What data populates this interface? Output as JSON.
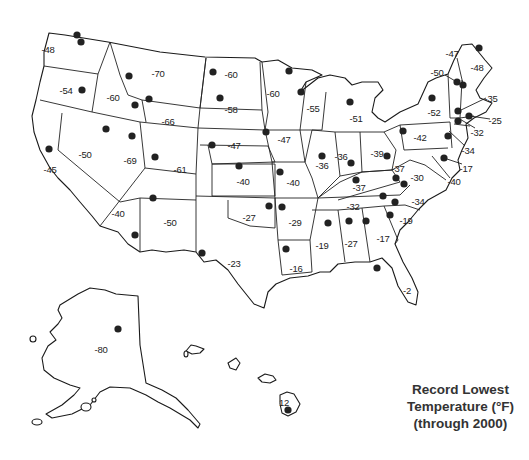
{
  "title": {
    "line1": "Record Lowest",
    "line2": "Temperature (°F)",
    "line3": "(through 2000)"
  },
  "states": [
    {
      "state": "Washington",
      "value": "-48",
      "x": 48,
      "y": 49
    },
    {
      "state": "Oregon",
      "value": "-54",
      "x": 66,
      "y": 90
    },
    {
      "state": "California",
      "value": "-45",
      "x": 50,
      "y": 169
    },
    {
      "state": "Nevada",
      "value": "-50",
      "x": 85,
      "y": 154
    },
    {
      "state": "Idaho",
      "value": "-60",
      "x": 113,
      "y": 97
    },
    {
      "state": "Montana",
      "value": "-70",
      "x": 158,
      "y": 73
    },
    {
      "state": "Wyoming",
      "value": "-66",
      "x": 168,
      "y": 121
    },
    {
      "state": "Utah",
      "value": "-69",
      "x": 130,
      "y": 160
    },
    {
      "state": "Colorado",
      "value": "-61",
      "x": 180,
      "y": 169
    },
    {
      "state": "Arizona",
      "value": "-40",
      "x": 118,
      "y": 213
    },
    {
      "state": "New Mexico",
      "value": "-50",
      "x": 170,
      "y": 222
    },
    {
      "state": "North Dakota",
      "value": "-60",
      "x": 231,
      "y": 74
    },
    {
      "state": "South Dakota",
      "value": "-58",
      "x": 231,
      "y": 109
    },
    {
      "state": "Nebraska",
      "value": "-47",
      "x": 234,
      "y": 145
    },
    {
      "state": "Kansas",
      "value": "-40",
      "x": 243,
      "y": 181
    },
    {
      "state": "Oklahoma",
      "value": "-27",
      "x": 249,
      "y": 217
    },
    {
      "state": "Texas",
      "value": "-23",
      "x": 234,
      "y": 263
    },
    {
      "state": "Minnesota",
      "value": "-60",
      "x": 273,
      "y": 93
    },
    {
      "state": "Iowa",
      "value": "-47",
      "x": 284,
      "y": 139
    },
    {
      "state": "Missouri",
      "value": "-40",
      "x": 293,
      "y": 182
    },
    {
      "state": "Arkansas",
      "value": "-29",
      "x": 295,
      "y": 222
    },
    {
      "state": "Louisiana",
      "value": "-16",
      "x": 296,
      "y": 268
    },
    {
      "state": "Wisconsin",
      "value": "-55",
      "x": 313,
      "y": 108
    },
    {
      "state": "Illinois",
      "value": "-36",
      "x": 322,
      "y": 165
    },
    {
      "state": "Michigan",
      "value": "-51",
      "x": 356,
      "y": 118
    },
    {
      "state": "Indiana",
      "value": "-36",
      "x": 341,
      "y": 156
    },
    {
      "state": "Ohio",
      "value": "-39",
      "x": 377,
      "y": 153
    },
    {
      "state": "Kentucky",
      "value": "-37",
      "x": 359,
      "y": 187
    },
    {
      "state": "Tennessee",
      "value": "-32",
      "x": 353,
      "y": 206
    },
    {
      "state": "Mississippi",
      "value": "-19",
      "x": 322,
      "y": 245
    },
    {
      "state": "Alabama",
      "value": "-27",
      "x": 351,
      "y": 243
    },
    {
      "state": "Georgia",
      "value": "-17",
      "x": 383,
      "y": 238
    },
    {
      "state": "Florida",
      "value": "-2",
      "x": 407,
      "y": 290
    },
    {
      "state": "South Carolina",
      "value": "-19",
      "x": 406,
      "y": 220
    },
    {
      "state": "North Carolina",
      "value": "-34",
      "x": 418,
      "y": 201
    },
    {
      "state": "Virginia",
      "value": "-30",
      "x": 417,
      "y": 177
    },
    {
      "state": "West Virginia",
      "value": "-37",
      "x": 398,
      "y": 168
    },
    {
      "state": "Pennsylvania",
      "value": "-42",
      "x": 420,
      "y": 137
    },
    {
      "state": "New York",
      "value": "-52",
      "x": 434,
      "y": 112
    },
    {
      "state": "Maryland",
      "value": "-40",
      "x": 454,
      "y": 181
    },
    {
      "state": "Delaware",
      "value": "-17",
      "x": 466,
      "y": 168
    },
    {
      "state": "New Jersey",
      "value": "-34",
      "x": 468,
      "y": 150
    },
    {
      "state": "Connecticut",
      "value": "-32",
      "x": 477,
      "y": 132
    },
    {
      "state": "Rhode Island",
      "value": "-25",
      "x": 495,
      "y": 120
    },
    {
      "state": "Massachusetts",
      "value": "-35",
      "x": 491,
      "y": 98
    },
    {
      "state": "Vermont",
      "value": "-50",
      "x": 437,
      "y": 72
    },
    {
      "state": "New Hampshire",
      "value": "-47",
      "x": 452,
      "y": 53
    },
    {
      "state": "Maine",
      "value": "-48",
      "x": 477,
      "y": 67
    },
    {
      "state": "Alaska",
      "value": "-80",
      "x": 101,
      "y": 349
    },
    {
      "state": "Hawaii",
      "value": "12",
      "x": 284,
      "y": 402
    }
  ],
  "chart_data": {
    "type": "table",
    "title": "Record Lowest Temperature (°F) (through 2000)",
    "unit": "°F",
    "columns": [
      "state",
      "record_low_f"
    ],
    "rows": [
      [
        "Alabama",
        -27
      ],
      [
        "Alaska",
        -80
      ],
      [
        "Arizona",
        -40
      ],
      [
        "Arkansas",
        -29
      ],
      [
        "California",
        -45
      ],
      [
        "Colorado",
        -61
      ],
      [
        "Connecticut",
        -32
      ],
      [
        "Delaware",
        -17
      ],
      [
        "Florida",
        -2
      ],
      [
        "Georgia",
        -17
      ],
      [
        "Hawaii",
        12
      ],
      [
        "Idaho",
        -60
      ],
      [
        "Illinois",
        -36
      ],
      [
        "Indiana",
        -36
      ],
      [
        "Iowa",
        -47
      ],
      [
        "Kansas",
        -40
      ],
      [
        "Kentucky",
        -37
      ],
      [
        "Louisiana",
        -16
      ],
      [
        "Maine",
        -48
      ],
      [
        "Maryland",
        -40
      ],
      [
        "Massachusetts",
        -35
      ],
      [
        "Michigan",
        -51
      ],
      [
        "Minnesota",
        -60
      ],
      [
        "Mississippi",
        -19
      ],
      [
        "Missouri",
        -40
      ],
      [
        "Montana",
        -70
      ],
      [
        "Nebraska",
        -47
      ],
      [
        "Nevada",
        -50
      ],
      [
        "New Hampshire",
        -47
      ],
      [
        "New Jersey",
        -34
      ],
      [
        "New Mexico",
        -50
      ],
      [
        "New York",
        -52
      ],
      [
        "North Carolina",
        -34
      ],
      [
        "North Dakota",
        -60
      ],
      [
        "Ohio",
        -39
      ],
      [
        "Oklahoma",
        -27
      ],
      [
        "Oregon",
        -54
      ],
      [
        "Pennsylvania",
        -42
      ],
      [
        "Rhode Island",
        -25
      ],
      [
        "South Carolina",
        -19
      ],
      [
        "South Dakota",
        -58
      ],
      [
        "Tennessee",
        -32
      ],
      [
        "Texas",
        -23
      ],
      [
        "Utah",
        -69
      ],
      [
        "Vermont",
        -50
      ],
      [
        "Virginia",
        -30
      ],
      [
        "Washington",
        -48
      ],
      [
        "West Virginia",
        -37
      ],
      [
        "Wisconsin",
        -55
      ],
      [
        "Wyoming",
        -66
      ]
    ]
  }
}
